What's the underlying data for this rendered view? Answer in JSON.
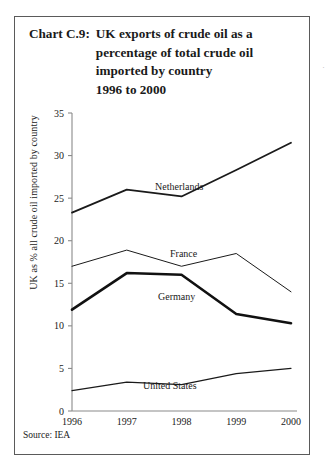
{
  "figure": {
    "number_label": "Chart C.9:",
    "title_lines": [
      "UK exports of crude oil as a",
      "percentage of total crude oil",
      "imported by country",
      "1996 to 2000"
    ],
    "source_note": "Source: IEA",
    "edge_artifact": "·"
  },
  "chart_data": {
    "type": "line",
    "title": "UK exports of crude oil as a percentage of total crude oil imported by country 1996 to 2000",
    "xlabel": "",
    "ylabel": "UK as % all crude oil imported by country",
    "categories": [
      "1996",
      "1997",
      "1998",
      "1999",
      "2000"
    ],
    "x_tick_labels": [
      "1996",
      "1997",
      "1998",
      "1999",
      "2000"
    ],
    "y_tick_labels": [
      "0",
      "5",
      "10",
      "15",
      "20",
      "25",
      "30",
      "35"
    ],
    "y_ticks": [
      0,
      5,
      10,
      15,
      20,
      25,
      30,
      35
    ],
    "ylim": [
      0,
      35
    ],
    "grid": false,
    "legend": "inline-labels",
    "series": [
      {
        "name": "Netherlands",
        "values": [
          23.3,
          26.0,
          25.2,
          28.3,
          31.5
        ],
        "color": "#1a1a1a",
        "width": 1.8,
        "label_x": 140,
        "label_y": 173
      },
      {
        "name": "France",
        "values": [
          17.0,
          18.9,
          17.0,
          18.5,
          14.0
        ],
        "color": "#1a1a1a",
        "width": 1.0,
        "label_x": 155,
        "label_y": 240
      },
      {
        "name": "Germany",
        "values": [
          11.9,
          16.2,
          16.0,
          11.4,
          10.3
        ],
        "color": "#111111",
        "width": 2.6,
        "label_x": 143,
        "label_y": 283
      },
      {
        "name": "United States",
        "values": [
          2.4,
          3.4,
          3.1,
          4.4,
          5.0
        ],
        "color": "#1a1a1a",
        "width": 1.2,
        "label_x": 128,
        "label_y": 372
      }
    ]
  }
}
